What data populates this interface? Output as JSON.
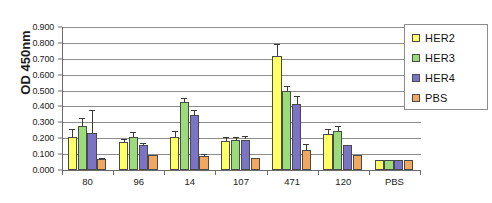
{
  "title": "",
  "chart_data": {
    "type": "bar",
    "title": "",
    "subtitle": "",
    "xlabel": "",
    "ylabel": "OD 450nm",
    "ylim": [
      0.0,
      0.9
    ],
    "ytick_step": 0.1,
    "ytick_labels": [
      "0.900",
      "0.800",
      "0.700",
      "0.600",
      "0.500",
      "0.400",
      "0.300",
      "0.200",
      "0.100",
      "0.000"
    ],
    "ytick_values": [
      0.9,
      0.8,
      0.7,
      0.6,
      0.5,
      0.4,
      0.3,
      0.2,
      0.1,
      0.0
    ],
    "grid": "horizontal",
    "legend_position": "top-right",
    "categories": [
      "80",
      "96",
      "14",
      "107",
      "471",
      "120",
      "PBS"
    ],
    "series": [
      {
        "name": "HER2",
        "color": "#FFFF66",
        "values": [
          0.21,
          0.175,
          0.21,
          0.185,
          0.72,
          0.225,
          0.065
        ],
        "errors": [
          0.048,
          0.018,
          0.035,
          0.02,
          0.075,
          0.03,
          0.0
        ]
      },
      {
        "name": "HER3",
        "color": "#9BDB7A",
        "values": [
          0.278,
          0.21,
          0.425,
          0.188,
          0.495,
          0.248,
          0.065
        ],
        "errors": [
          0.05,
          0.028,
          0.028,
          0.018,
          0.035,
          0.03,
          0.0
        ]
      },
      {
        "name": "HER4",
        "color": "#7B74C4",
        "values": [
          0.235,
          0.158,
          0.345,
          0.192,
          0.415,
          0.158,
          0.062
        ],
        "errors": [
          0.145,
          0.012,
          0.03,
          0.022,
          0.05,
          0.0,
          0.0
        ]
      },
      {
        "name": "PBS",
        "color": "#F0A860",
        "values": [
          0.072,
          0.095,
          0.09,
          0.078,
          0.128,
          0.095,
          0.065
        ],
        "errors": [
          0.006,
          0.0,
          0.01,
          0.0,
          0.035,
          0.0,
          0.0
        ]
      }
    ]
  },
  "legend": {
    "items": [
      {
        "label": "HER2",
        "color": "#FFFF66"
      },
      {
        "label": "HER3",
        "color": "#9BDB7A"
      },
      {
        "label": "HER4",
        "color": "#7B74C4"
      },
      {
        "label": "PBS",
        "color": "#F0A860"
      }
    ]
  },
  "colors": {
    "grid": "#8d8d8d",
    "axis": "#6b6b6b",
    "bar_border": "#4a4a4a",
    "text": "#222222"
  }
}
